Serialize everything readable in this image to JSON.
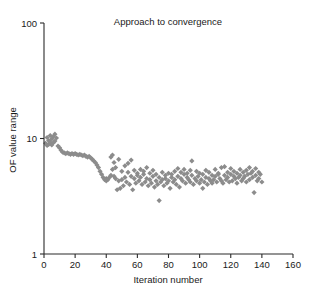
{
  "chart_data": {
    "type": "scatter",
    "title": "Approach to convergence",
    "xlabel": "Iteration number",
    "ylabel": "OF value range",
    "xlim": [
      0,
      160
    ],
    "ylim": [
      1,
      100
    ],
    "yscale": "log",
    "xscale": "linear",
    "grid": false,
    "legend": null,
    "marker": {
      "shape": "diamond",
      "color": "#8c8c8c",
      "size": 3.4
    },
    "xticks": [
      0,
      20,
      40,
      60,
      80,
      100,
      120,
      140,
      160
    ],
    "xtick_labels": [
      "0",
      "20",
      "40",
      "60",
      "80",
      "100",
      "120",
      "140",
      "160"
    ],
    "yticks": [
      1,
      10,
      100
    ],
    "ytick_labels": [
      "1",
      "10",
      "100"
    ],
    "series": [
      {
        "name": "OF value range",
        "points": [
          [
            1,
            9.1
          ],
          [
            2,
            8.7
          ],
          [
            2,
            10.2
          ],
          [
            3,
            9.6
          ],
          [
            3,
            8.9
          ],
          [
            4,
            10.6
          ],
          [
            4,
            9.3
          ],
          [
            5,
            9.9
          ],
          [
            5,
            8.8
          ],
          [
            6,
            10.4
          ],
          [
            6,
            9.2
          ],
          [
            7,
            10.9
          ],
          [
            7,
            9.5
          ],
          [
            8,
            10.1
          ],
          [
            9,
            8.6
          ],
          [
            10,
            8.3
          ],
          [
            11,
            7.9
          ],
          [
            12,
            7.6
          ],
          [
            13,
            7.5
          ],
          [
            14,
            7.4
          ],
          [
            15,
            7.5
          ],
          [
            16,
            7.4
          ],
          [
            17,
            7.3
          ],
          [
            18,
            7.4
          ],
          [
            19,
            7.3
          ],
          [
            20,
            7.4
          ],
          [
            21,
            7.3
          ],
          [
            22,
            7.2
          ],
          [
            23,
            7.3
          ],
          [
            24,
            7.2
          ],
          [
            25,
            7.1
          ],
          [
            26,
            7.2
          ],
          [
            27,
            7.0
          ],
          [
            28,
            6.9
          ],
          [
            29,
            7.0
          ],
          [
            30,
            6.8
          ],
          [
            31,
            6.6
          ],
          [
            32,
            6.4
          ],
          [
            33,
            6.2
          ],
          [
            34,
            5.9
          ],
          [
            35,
            5.6
          ],
          [
            36,
            5.2
          ],
          [
            37,
            4.9
          ],
          [
            38,
            4.6
          ],
          [
            39,
            4.4
          ],
          [
            40,
            4.3
          ],
          [
            40,
            4.5
          ],
          [
            41,
            4.4
          ],
          [
            42,
            4.6
          ],
          [
            43,
            4.8
          ],
          [
            43,
            6.9
          ],
          [
            44,
            5.4
          ],
          [
            44,
            7.2
          ],
          [
            45,
            4.7
          ],
          [
            45,
            6.2
          ],
          [
            46,
            4.5
          ],
          [
            46,
            5.6
          ],
          [
            47,
            3.6
          ],
          [
            48,
            4.3
          ],
          [
            48,
            6.6
          ],
          [
            49,
            3.7
          ],
          [
            50,
            4.4
          ],
          [
            50,
            5.2
          ],
          [
            51,
            3.9
          ],
          [
            52,
            4.6
          ],
          [
            52,
            5.8
          ],
          [
            53,
            4.2
          ],
          [
            54,
            5.1
          ],
          [
            54,
            6.1
          ],
          [
            55,
            4.0
          ],
          [
            56,
            4.7
          ],
          [
            56,
            6.5
          ],
          [
            57,
            3.6
          ],
          [
            58,
            4.5
          ],
          [
            58,
            5.3
          ],
          [
            59,
            4.1
          ],
          [
            60,
            4.8
          ],
          [
            60,
            5.0
          ],
          [
            61,
            4.3
          ],
          [
            62,
            4.6
          ],
          [
            62,
            5.4
          ],
          [
            63,
            4.0
          ],
          [
            64,
            4.9
          ],
          [
            64,
            5.2
          ],
          [
            65,
            4.2
          ],
          [
            66,
            4.5
          ],
          [
            66,
            5.6
          ],
          [
            67,
            3.9
          ],
          [
            68,
            4.4
          ],
          [
            68,
            5.0
          ],
          [
            69,
            4.1
          ],
          [
            70,
            4.7
          ],
          [
            70,
            5.3
          ],
          [
            71,
            3.8
          ],
          [
            72,
            4.3
          ],
          [
            72,
            4.9
          ],
          [
            73,
            4.0
          ],
          [
            74,
            2.9
          ],
          [
            74,
            4.6
          ],
          [
            75,
            4.2
          ],
          [
            76,
            4.4
          ],
          [
            76,
            5.1
          ],
          [
            77,
            3.9
          ],
          [
            78,
            4.5
          ],
          [
            78,
            4.8
          ],
          [
            79,
            4.1
          ],
          [
            80,
            4.3
          ],
          [
            80,
            5.0
          ],
          [
            81,
            3.7
          ],
          [
            82,
            4.6
          ],
          [
            82,
            4.9
          ],
          [
            83,
            4.2
          ],
          [
            84,
            4.4
          ],
          [
            84,
            5.2
          ],
          [
            85,
            4.0
          ],
          [
            86,
            4.7
          ],
          [
            86,
            5.5
          ],
          [
            87,
            3.8
          ],
          [
            88,
            4.5
          ],
          [
            88,
            5.1
          ],
          [
            89,
            4.3
          ],
          [
            90,
            4.9
          ],
          [
            90,
            5.4
          ],
          [
            91,
            4.1
          ],
          [
            92,
            4.6
          ],
          [
            92,
            5.0
          ],
          [
            93,
            4.4
          ],
          [
            94,
            4.2
          ],
          [
            94,
            5.3
          ],
          [
            95,
            6.4
          ],
          [
            95,
            4.8
          ],
          [
            96,
            4.0
          ],
          [
            97,
            4.5
          ],
          [
            98,
            5.2
          ],
          [
            98,
            4.3
          ],
          [
            99,
            4.7
          ],
          [
            100,
            4.1
          ],
          [
            100,
            5.0
          ],
          [
            101,
            4.4
          ],
          [
            102,
            3.7
          ],
          [
            102,
            4.9
          ],
          [
            103,
            4.2
          ],
          [
            104,
            4.6
          ],
          [
            104,
            5.3
          ],
          [
            105,
            4.0
          ],
          [
            106,
            4.5
          ],
          [
            106,
            5.1
          ],
          [
            107,
            4.3
          ],
          [
            108,
            4.8
          ],
          [
            108,
            4.1
          ],
          [
            109,
            4.4
          ],
          [
            110,
            4.7
          ],
          [
            110,
            5.4
          ],
          [
            111,
            4.2
          ],
          [
            112,
            4.9
          ],
          [
            112,
            5.0
          ],
          [
            113,
            4.5
          ],
          [
            114,
            4.3
          ],
          [
            114,
            5.6
          ],
          [
            115,
            4.1
          ],
          [
            116,
            4.8
          ],
          [
            116,
            5.7
          ],
          [
            117,
            4.4
          ],
          [
            118,
            5.1
          ],
          [
            118,
            4.6
          ],
          [
            119,
            4.2
          ],
          [
            120,
            4.9
          ],
          [
            120,
            5.5
          ],
          [
            121,
            4.3
          ],
          [
            122,
            4.7
          ],
          [
            122,
            5.2
          ],
          [
            123,
            4.5
          ],
          [
            124,
            4.1
          ],
          [
            124,
            5.0
          ],
          [
            125,
            4.6
          ],
          [
            126,
            4.8
          ],
          [
            126,
            5.4
          ],
          [
            127,
            4.3
          ],
          [
            128,
            5.1
          ],
          [
            128,
            4.5
          ],
          [
            129,
            4.7
          ],
          [
            130,
            4.2
          ],
          [
            130,
            5.3
          ],
          [
            131,
            4.9
          ],
          [
            132,
            4.4
          ],
          [
            132,
            5.6
          ],
          [
            133,
            5.0
          ],
          [
            134,
            4.6
          ],
          [
            134,
            5.2
          ],
          [
            135,
            3.4
          ],
          [
            136,
            4.8
          ],
          [
            136,
            5.5
          ],
          [
            137,
            4.3
          ],
          [
            138,
            5.1
          ],
          [
            138,
            4.5
          ],
          [
            139,
            4.9
          ],
          [
            140,
            4.2
          ]
        ]
      }
    ]
  },
  "caption": {
    "text": ""
  }
}
